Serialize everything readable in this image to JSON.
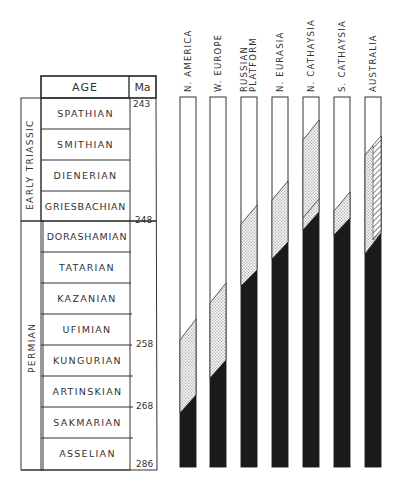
{
  "table": {
    "header_age": "AGE",
    "header_ma": "Ma",
    "periods": [
      {
        "label": "EARLY TRIASSIC"
      },
      {
        "label": "PERMIAN"
      }
    ],
    "stages": [
      {
        "name": "SPATHIAN"
      },
      {
        "name": "SMITHIAN"
      },
      {
        "name": "DIENERIAN"
      },
      {
        "name": "GRIESBACHIAN"
      },
      {
        "name": "DORASHAMIAN"
      },
      {
        "name": "TATARIAN"
      },
      {
        "name": "KAZANIAN"
      },
      {
        "name": "UFIMIAN"
      },
      {
        "name": "KUNGURIAN"
      },
      {
        "name": "ARTINSKIAN"
      },
      {
        "name": "SAKMARIAN"
      },
      {
        "name": "ASSELIAN"
      }
    ],
    "ma_ticks": [
      "243",
      "248",
      "258",
      "268",
      "286"
    ]
  },
  "regions": [
    {
      "name": "N. AMERICA"
    },
    {
      "name": "W. EUROPE"
    },
    {
      "name": "RUSSIAN\nPLATFORM"
    },
    {
      "name": "N. EURASIA"
    },
    {
      "name": "N. CATHAYSIA"
    },
    {
      "name": "S. CATHAYSIA"
    },
    {
      "name": "AUSTRALIA"
    }
  ],
  "colors": {
    "line": "#333333",
    "black_fill": "#1a1a1a",
    "stipple": "#bdbdbd"
  }
}
